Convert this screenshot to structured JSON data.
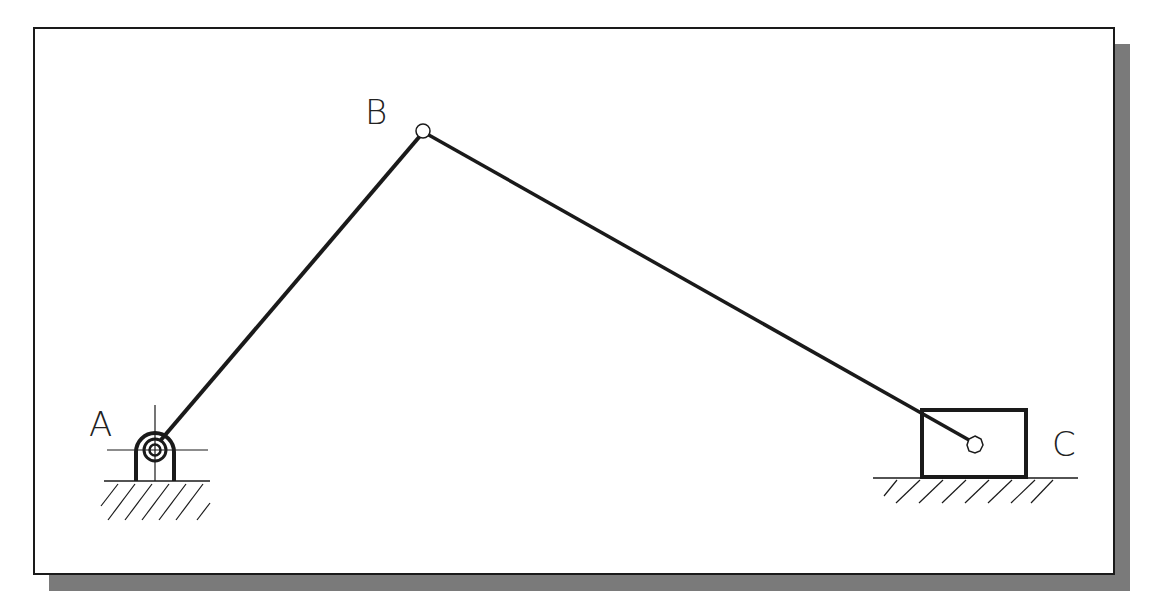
{
  "diagram": {
    "type": "slider-crank mechanism",
    "labels": {
      "A": "A",
      "B": "B",
      "C": "C"
    },
    "points": {
      "A": {
        "x": 155,
        "y": 450
      },
      "B": {
        "x": 423,
        "y": 131
      },
      "C": {
        "x": 975,
        "y": 444
      }
    },
    "components": [
      {
        "name": "ground-pivot",
        "at": "A"
      },
      {
        "name": "crank",
        "from": "A",
        "to": "B"
      },
      {
        "name": "connecting-rod",
        "from": "B",
        "to": "C"
      },
      {
        "name": "slider-block",
        "at": "C"
      }
    ],
    "colors": {
      "line": "#1a1a1a",
      "shadow": "#7a7a7a",
      "background": "#ffffff"
    }
  }
}
